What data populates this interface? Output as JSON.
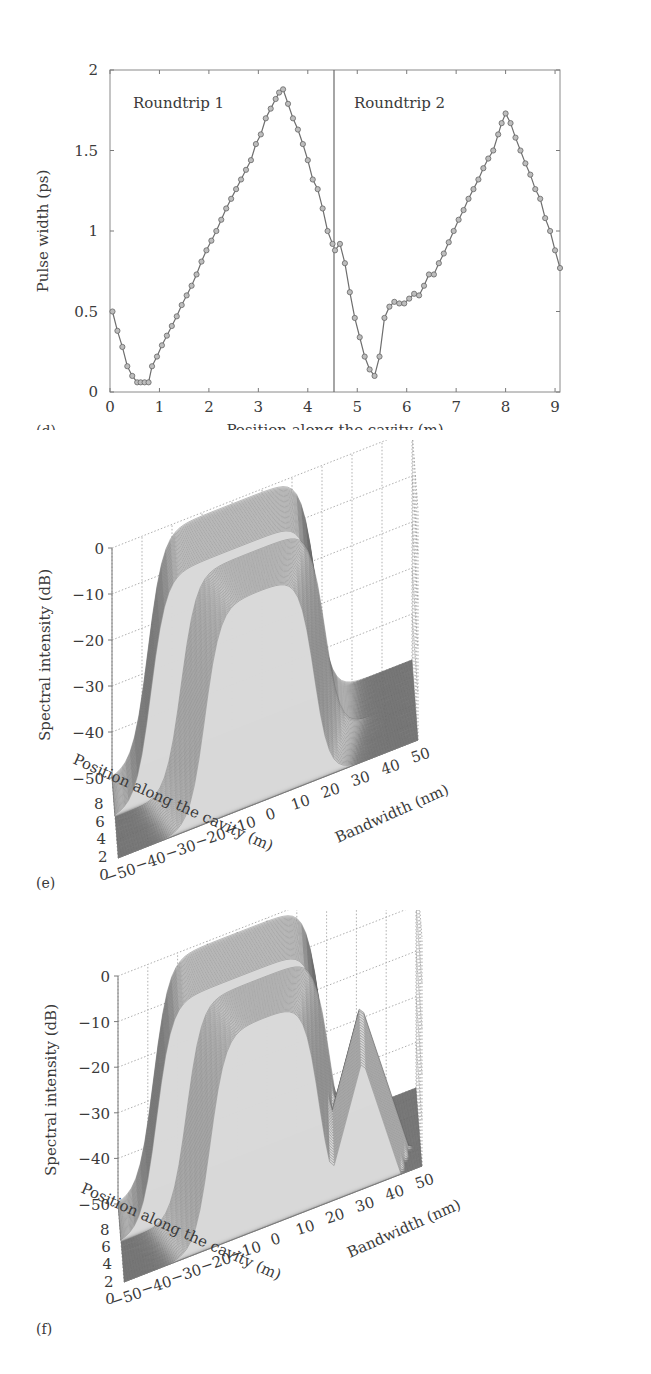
{
  "chart_data": [
    {
      "panel": "(d)",
      "type": "line",
      "title": "",
      "xlabel": "Position along the cavity (m)",
      "ylabel": "Pulse width (ps)",
      "xlim": [
        0,
        9.1
      ],
      "ylim": [
        0,
        2
      ],
      "xticks": [
        "0",
        "1",
        "2",
        "3",
        "4",
        "5",
        "6",
        "7",
        "8",
        "9"
      ],
      "yticks": [
        "0",
        "0.5",
        "1",
        "1.5",
        "2"
      ],
      "grid": false,
      "marker": "circle",
      "separator_x": 4.55,
      "annotations": [
        "Roundtrip 1",
        "Roundtrip 2"
      ],
      "series": [
        {
          "name": "Roundtrip 1",
          "x": [
            0.05,
            0.15,
            0.25,
            0.35,
            0.45,
            0.55,
            0.62,
            0.7,
            0.78,
            0.85,
            0.95,
            1.05,
            1.15,
            1.25,
            1.35,
            1.45,
            1.55,
            1.65,
            1.75,
            1.85,
            1.95,
            2.05,
            2.15,
            2.25,
            2.35,
            2.45,
            2.55,
            2.65,
            2.75,
            2.85,
            2.95,
            3.05,
            3.15,
            3.25,
            3.35,
            3.42,
            3.5,
            3.6,
            3.7,
            3.8,
            3.9,
            4.0,
            4.1,
            4.2,
            4.3,
            4.4,
            4.5
          ],
          "y": [
            0.5,
            0.38,
            0.28,
            0.16,
            0.1,
            0.06,
            0.06,
            0.06,
            0.06,
            0.16,
            0.22,
            0.29,
            0.35,
            0.41,
            0.47,
            0.54,
            0.6,
            0.66,
            0.73,
            0.81,
            0.88,
            0.94,
            1.0,
            1.07,
            1.14,
            1.2,
            1.26,
            1.32,
            1.38,
            1.44,
            1.54,
            1.6,
            1.7,
            1.76,
            1.82,
            1.86,
            1.88,
            1.79,
            1.7,
            1.63,
            1.54,
            1.44,
            1.32,
            1.26,
            1.14,
            1.0,
            0.92
          ]
        },
        {
          "name": "Roundtrip 2",
          "x": [
            4.55,
            4.65,
            4.75,
            4.85,
            4.95,
            5.05,
            5.15,
            5.25,
            5.35,
            5.45,
            5.55,
            5.65,
            5.75,
            5.85,
            5.95,
            6.05,
            6.15,
            6.25,
            6.35,
            6.45,
            6.55,
            6.65,
            6.75,
            6.85,
            6.95,
            7.05,
            7.15,
            7.25,
            7.35,
            7.45,
            7.55,
            7.65,
            7.75,
            7.85,
            7.92,
            8.0,
            8.1,
            8.2,
            8.3,
            8.4,
            8.5,
            8.6,
            8.7,
            8.8,
            8.9,
            9.0,
            9.1
          ],
          "y": [
            0.88,
            0.92,
            0.8,
            0.62,
            0.46,
            0.34,
            0.22,
            0.14,
            0.1,
            0.22,
            0.46,
            0.53,
            0.56,
            0.55,
            0.55,
            0.58,
            0.61,
            0.6,
            0.66,
            0.73,
            0.73,
            0.8,
            0.86,
            0.93,
            1.0,
            1.07,
            1.13,
            1.2,
            1.26,
            1.32,
            1.39,
            1.45,
            1.5,
            1.6,
            1.67,
            1.73,
            1.67,
            1.58,
            1.5,
            1.42,
            1.35,
            1.26,
            1.2,
            1.08,
            1.0,
            0.88,
            0.77
          ]
        }
      ]
    },
    {
      "panel": "(e)",
      "type": "surface3d",
      "title": "",
      "xlabel": "Bandwidth (nm)",
      "ylabel": "Position along the cavity (m)",
      "zlabel": "Spectral intensity (dB)",
      "xlim": [
        -50,
        50
      ],
      "ylim": [
        0,
        9
      ],
      "zlim": [
        -50,
        0
      ],
      "xticks": [
        "-50",
        "-40",
        "-30",
        "-20",
        "-10",
        "0",
        "10",
        "20",
        "30",
        "40",
        "50"
      ],
      "yticks": [
        "0",
        "2",
        "4",
        "6",
        "8"
      ],
      "zticks": [
        "0",
        "-10",
        "-20",
        "-30",
        "-40",
        "-50"
      ],
      "grid": true,
      "description": "Mesh surface: flat-top spectrum roughly -35 to +20 nm at about 0 dB for roundtrip 1, narrowing around position ~4.5 m and broadening again in roundtrip 2; floor at -50 dB elsewhere."
    },
    {
      "panel": "(f)",
      "type": "surface3d",
      "title": "",
      "xlabel": "Bandwidth (nm)",
      "ylabel": "Position along the cavity (m)",
      "zlabel": "Spectral intensity (dB)",
      "xlim": [
        -50,
        50
      ],
      "ylim": [
        0,
        9
      ],
      "zlim": [
        -50,
        0
      ],
      "xticks": [
        "-50",
        "-40",
        "-30",
        "-20",
        "-10",
        "0",
        "10",
        "20",
        "30",
        "40",
        "50"
      ],
      "yticks": [
        "0",
        "2",
        "4",
        "6",
        "8"
      ],
      "zticks": [
        "0",
        "-10",
        "-20",
        "-30",
        "-40",
        "-50"
      ],
      "grid": true,
      "description": "Mesh surface with broad spectrum near 0 dB, side peaks near +30 nm around -15 dB, and structured sidebands; floor at -50 dB."
    }
  ],
  "panels": {
    "d": {
      "letter": "(d)",
      "xlabel": "Position along the cavity (m)",
      "ylabel": "Pulse width (ps)",
      "annot1": "Roundtrip 1",
      "annot2": "Roundtrip 2",
      "xticks": [
        "0",
        "1",
        "2",
        "3",
        "4",
        "5",
        "6",
        "7",
        "8",
        "9"
      ],
      "yticks": [
        "0",
        "0.5",
        "1",
        "1.5",
        "2"
      ]
    },
    "e": {
      "letter": "(e)",
      "zlabel": "Spectral intensity (dB)",
      "ylabel": "Position along the cavity (m)",
      "xlabel": "Bandwidth (nm)",
      "zticks": [
        "0",
        "−10",
        "−20",
        "−30",
        "−40",
        "−50"
      ],
      "yticks": [
        "8",
        "6",
        "4",
        "2",
        "0"
      ],
      "xticks": [
        "−50",
        "−40",
        "−30",
        "−20",
        "−10",
        "0",
        "10",
        "20",
        "30",
        "40",
        "50"
      ]
    },
    "f": {
      "letter": "(f)",
      "zlabel": "Spectral intensity (dB)",
      "ylabel": "Position along the cavity (m)",
      "xlabel": "Bandwidth (nm)",
      "zticks": [
        "0",
        "−10",
        "−20",
        "−30",
        "−40",
        "−50"
      ],
      "yticks": [
        "8",
        "6",
        "4",
        "2",
        "0"
      ],
      "xticks": [
        "−50",
        "−40",
        "−30",
        "−20",
        "−10",
        "0",
        "10",
        "20",
        "30",
        "40",
        "50"
      ]
    }
  },
  "colors": {
    "axis": "#7a7a7a",
    "line": "#6e6e6e",
    "marker_fill": "#bdbdbd",
    "marker_edge": "#666666",
    "mesh": "#555555",
    "floor": "#8c8c8c",
    "grid": "#9a9a9a"
  }
}
